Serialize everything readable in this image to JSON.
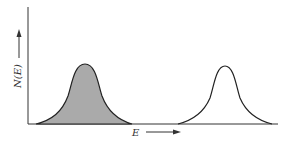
{
  "diagram": {
    "type": "energy distribution plot",
    "y_axis_label": "N(E)",
    "x_axis_label": "E",
    "peaks": [
      {
        "name": "left-peak",
        "filled": true,
        "center_x": 84,
        "fill_color": "#aaaaaa"
      },
      {
        "name": "right-peak",
        "filled": false,
        "center_x": 225
      }
    ],
    "colors": {
      "line": "#222222",
      "fill": "#aaaaaa",
      "background": "#ffffff"
    }
  }
}
